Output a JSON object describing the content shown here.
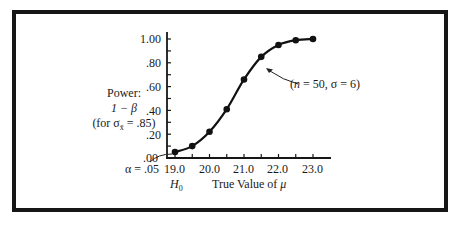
{
  "chart_data": {
    "type": "line",
    "title": "",
    "xlabel": "True Value of μ",
    "ylabel": [
      "Power:",
      "1 − β",
      "(for σx̄ = .85)"
    ],
    "x": [
      19.0,
      19.5,
      20.0,
      20.5,
      21.0,
      21.5,
      22.0,
      22.5,
      23.0
    ],
    "series": [
      {
        "name": "(n = 50, σ = 6)",
        "values": [
          0.05,
          0.1,
          0.22,
          0.41,
          0.66,
          0.85,
          0.95,
          0.99,
          1.0
        ]
      }
    ],
    "xticks": [
      "19.0",
      "20.0",
      "21.0",
      "22.0",
      "23.0"
    ],
    "yticks": [
      ".00",
      ".20",
      ".40",
      ".60",
      ".80",
      "1.00"
    ],
    "xlim": [
      18.75,
      23.5
    ],
    "ylim": [
      0,
      1.05
    ],
    "grid": false,
    "annotations": [
      {
        "text": "(n = 50, σ = 6)",
        "points_to": [
          21.6,
          0.8
        ]
      },
      {
        "text": "α = .05",
        "points_to": [
          19.0,
          0.05
        ]
      },
      {
        "text": "H0",
        "at_x": 19.0
      }
    ]
  },
  "labels": {
    "power": "Power:",
    "one_minus_beta": "1 − β",
    "for_sigma": "(for σ",
    "sigma_sub": "x̄",
    "for_sigma_tail": " = .85)",
    "xlabel_text": "True Value of ",
    "xlabel_mu": "μ",
    "alpha": "α = .05",
    "h0_main": "H",
    "h0_sub": "0",
    "annotation_open": "(",
    "annotation_n": "n",
    "annotation_rest": " = 50, σ = 6)",
    "yticks": [
      ".00",
      ".20",
      ".40",
      ".60",
      ".80",
      "1.00"
    ],
    "xticks": [
      "19.0",
      "20.0",
      "21.0",
      "22.0",
      "23.0"
    ]
  }
}
